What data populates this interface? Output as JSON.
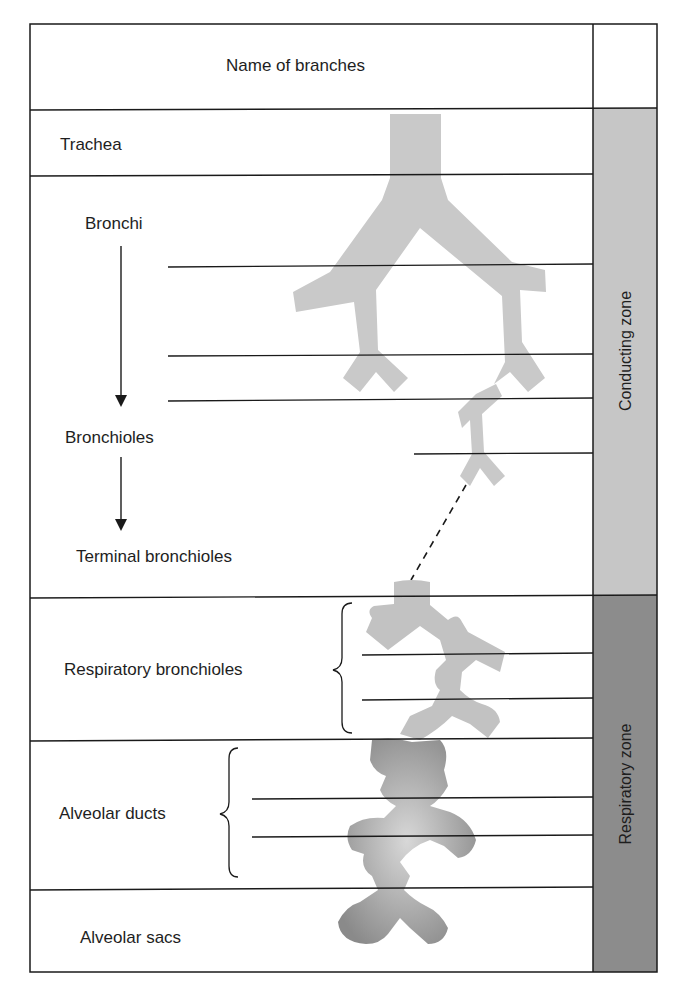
{
  "header": {
    "title": "Name of branches"
  },
  "rows": [
    {
      "label": "Trachea"
    },
    {
      "label": "Bronchi"
    },
    {
      "label": "Bronchioles"
    },
    {
      "label": "Terminal bronchioles"
    },
    {
      "label": "Respiratory bronchioles"
    },
    {
      "label": "Alveolar ducts"
    },
    {
      "label": "Alveolar sacs"
    }
  ],
  "zones": [
    {
      "label": "Conducting zone",
      "color": "#c6c6c6"
    },
    {
      "label": "Respiratory zone",
      "color": "#8c8c8c"
    }
  ],
  "colors": {
    "airway": "#c9c9c9",
    "airway_dark": "#8e8e8e",
    "line": "#1a1a1a"
  }
}
